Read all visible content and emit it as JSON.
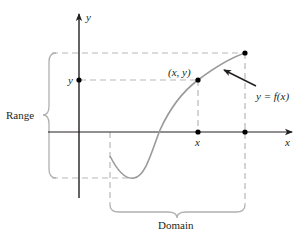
{
  "diagram": {
    "axes": {
      "x_label": "x",
      "y_label": "y"
    },
    "labels": {
      "point": "(x, y)",
      "function": "y = f(x)",
      "range": "Range",
      "domain": "Domain",
      "x_tick": "x",
      "y_tick": "y"
    },
    "colors": {
      "axis": "#231f20",
      "curve": "#9a9a9a",
      "dashed": "#b5b5b5",
      "brace": "#b5b5b5",
      "point": "#000000"
    }
  }
}
